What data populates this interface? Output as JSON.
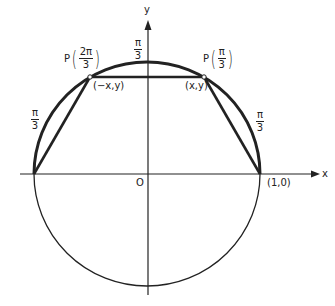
{
  "diagram": {
    "axes": {
      "x_label": "x",
      "y_label": "y",
      "origin_label": "O"
    },
    "points": {
      "p_right": {
        "name": "P",
        "angle_num": "π",
        "angle_den": "3",
        "coord_label": "(x,y)"
      },
      "p_left": {
        "name": "P",
        "angle_num": "2π",
        "angle_den": "3",
        "coord_label": "(−x,y)"
      },
      "unit_point": {
        "label": "(1,0)"
      }
    },
    "arc_labels": {
      "top": {
        "num": "π",
        "den": "3"
      },
      "left": {
        "num": "π",
        "den": "3"
      },
      "right": {
        "num": "π",
        "den": "3"
      }
    },
    "colors": {
      "stroke": "#222222",
      "background": "#ffffff"
    }
  }
}
